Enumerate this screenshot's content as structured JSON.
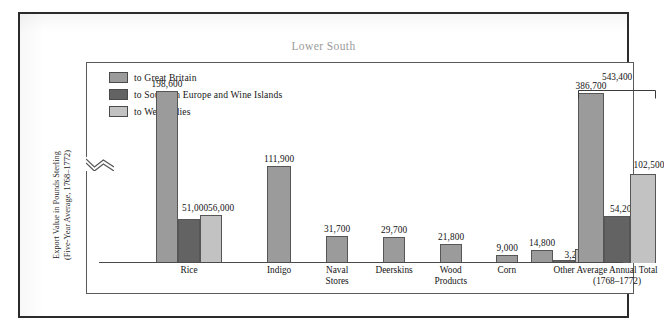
{
  "figure": {
    "title": "Lower South",
    "y_axis_label_line1": "Export Value in Pounds Sterling",
    "y_axis_label_line2": "(Five-Year Average, 1768–1772)"
  },
  "legend": {
    "position": "top-left",
    "items": [
      {
        "label": "to Great Britain",
        "color": "#9b9b9b",
        "key": "gb"
      },
      {
        "label": "to Southern Europe and Wine Islands",
        "color": "#636363",
        "key": "se"
      },
      {
        "label": "to West Indies",
        "color": "#c2c2c2",
        "key": "wi"
      }
    ]
  },
  "total_bracket": {
    "label": "543,400"
  },
  "chart_data": {
    "type": "bar",
    "title": "Lower South",
    "xlabel": "",
    "ylabel": "Export Value in Pounds Sterling (Five-Year Average, 1768–1772)",
    "ylim": [
      0,
      560000
    ],
    "grid": false,
    "legend_position": "top-left",
    "note": "The 'to Great Britain' bar of the Average Annual Total group is drawn with an axis break (zigzag).",
    "categories": [
      "Rice",
      "Indigo",
      "Naval Stores",
      "Deerskins",
      "Wood Products",
      "Corn",
      "Other",
      "Average Annual Total (1768–1772)"
    ],
    "category_labels": [
      {
        "line1": "Rice",
        "line2": ""
      },
      {
        "line1": "Indigo",
        "line2": ""
      },
      {
        "line1": "Naval",
        "line2": "Stores"
      },
      {
        "line1": "Deerskins",
        "line2": ""
      },
      {
        "line1": "Wood",
        "line2": "Products"
      },
      {
        "line1": "Corn",
        "line2": ""
      },
      {
        "line1": "Other",
        "line2": ""
      },
      {
        "line1": "Average Annual Total",
        "line2": "(1768–1772)"
      }
    ],
    "series": [
      {
        "name": "to Great Britain",
        "color": "#9b9b9b",
        "values": [
          198600,
          111900,
          31700,
          29700,
          21800,
          9000,
          14800,
          386700
        ]
      },
      {
        "name": "to Southern Europe and Wine Islands",
        "color": "#636363",
        "values": [
          51000,
          null,
          null,
          null,
          null,
          null,
          3200,
          54200
        ]
      },
      {
        "name": "to West Indies",
        "color": "#c2c2c2",
        "values": [
          56000,
          null,
          null,
          null,
          null,
          null,
          15700,
          102500
        ]
      }
    ],
    "value_labels": [
      "198,600",
      "51,000",
      "56,000",
      "111,900",
      "31,700",
      "29,700",
      "21,800",
      "9,000",
      "14,800",
      "3,200",
      "15,700",
      "386,700",
      "54,200",
      "102,500"
    ],
    "annotations": [
      {
        "text": "543,400",
        "type": "bracket-total",
        "target": "Average Annual Total (1768–1772)"
      }
    ]
  }
}
